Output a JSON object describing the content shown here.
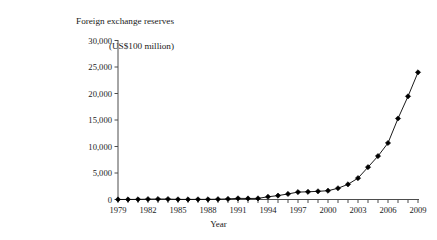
{
  "chart_data": {
    "type": "line",
    "title": "Foreign exchange reserves\n(US$100 million)",
    "title_line1": "Foreign exchange reserves",
    "title_line2": "(US$100 million)",
    "xlabel": "Year",
    "ylabel": "",
    "xlim": [
      1979,
      2009
    ],
    "ylim": [
      0,
      30000
    ],
    "grid": false,
    "legend": false,
    "marker": "diamond",
    "line_color": "#000000",
    "marker_color": "#000000",
    "ytick_labels": [
      "0",
      "5,000",
      "10,000",
      "15,000",
      "20,000",
      "25,000",
      "30,000"
    ],
    "ytick_values": [
      0,
      5000,
      10000,
      15000,
      20000,
      25000,
      30000
    ],
    "xtick_labels": [
      "1979",
      "1982",
      "1985",
      "1988",
      "1991",
      "1994",
      "1997",
      "2000",
      "2003",
      "2006",
      "2009"
    ],
    "xtick_values": [
      1979,
      1982,
      1985,
      1988,
      1991,
      1994,
      1997,
      2000,
      2003,
      2006,
      2009
    ],
    "x": [
      1979,
      1980,
      1981,
      1982,
      1983,
      1984,
      1985,
      1986,
      1987,
      1988,
      1989,
      1990,
      1991,
      1992,
      1993,
      1994,
      1995,
      1996,
      1997,
      1998,
      1999,
      2000,
      2001,
      2002,
      2003,
      2004,
      2005,
      2006,
      2007,
      2008,
      2009
    ],
    "values": [
      8,
      13,
      27,
      70,
      89,
      82,
      26,
      21,
      29,
      34,
      56,
      111,
      217,
      194,
      212,
      516,
      736,
      1050,
      1399,
      1450,
      1547,
      1656,
      2122,
      2864,
      4033,
      6099,
      8189,
      10663,
      15282,
      19460,
      23992
    ],
    "series": [
      {
        "name": "Foreign exchange reserves",
        "values": [
          8,
          13,
          27,
          70,
          89,
          82,
          26,
          21,
          29,
          34,
          56,
          111,
          217,
          194,
          212,
          516,
          736,
          1050,
          1399,
          1450,
          1547,
          1656,
          2122,
          2864,
          4033,
          6099,
          8189,
          10663,
          15282,
          19460,
          23992
        ]
      }
    ]
  }
}
